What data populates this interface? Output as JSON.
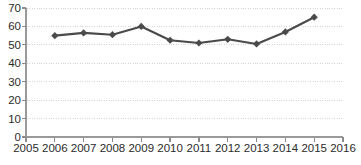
{
  "chart_data": {
    "type": "line",
    "title": "",
    "subtitle": "",
    "xlabel": "",
    "ylabel": "",
    "x": [
      2006,
      2007,
      2008,
      2009,
      2010,
      2011,
      2012,
      2013,
      2014,
      2015
    ],
    "values": [
      55,
      56.5,
      55.5,
      60,
      52.5,
      51,
      53,
      50.5,
      57,
      65
    ],
    "series": [
      {
        "name": "series-1",
        "values": [
          55,
          56.5,
          55.5,
          60,
          52.5,
          51,
          53,
          50.5,
          57,
          65
        ]
      }
    ],
    "xlim": [
      2005,
      2016
    ],
    "ylim": [
      0,
      70
    ],
    "x_tick_labels": [
      "2005",
      "2006",
      "2007",
      "2008",
      "2009",
      "2010",
      "2011",
      "2012",
      "2013",
      "2014",
      "2015",
      "2016"
    ],
    "x_ticks": [
      2005,
      2006,
      2007,
      2008,
      2009,
      2010,
      2011,
      2012,
      2013,
      2014,
      2015,
      2016
    ],
    "y_tick_labels": [
      "0",
      "10",
      "20",
      "30",
      "40",
      "50",
      "60",
      "70"
    ],
    "y_ticks": [
      0,
      10,
      20,
      30,
      40,
      50,
      60,
      70
    ],
    "grid": true,
    "grid_axis": "y",
    "legend": false,
    "legend_position": "none",
    "marker": "diamond",
    "colors": {
      "line": "#4a4a4a",
      "marker": "#4a4a4a",
      "grid": "#d6d6d6",
      "axis": "#9a9a9a",
      "text": "#2b2b2b",
      "background": "#ffffff"
    }
  },
  "layout": {
    "width": 361,
    "height": 165,
    "plot_left": 26,
    "plot_right": 343,
    "plot_top": 8,
    "plot_bottom": 137,
    "line_width": 2.1,
    "marker_size": 7.2,
    "y_label_x": 21,
    "x_label_y": 152
  }
}
